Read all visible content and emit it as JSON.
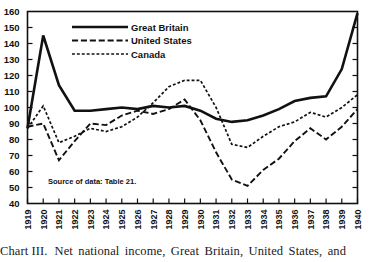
{
  "caption": {
    "number": "Chart III.",
    "text": "Net national income, Great Britain, United States, and"
  },
  "annotation": {
    "source": "Source of data:  Table 21."
  },
  "legend": {
    "position": "top-left-inside",
    "entries": [
      {
        "label": "Great Britain",
        "style": "solid"
      },
      {
        "label": "United States",
        "style": "long-dash"
      },
      {
        "label": "Canada",
        "style": "short-dash"
      }
    ]
  },
  "chart_data": {
    "type": "line",
    "title": "",
    "subtitle": "",
    "xlabel": "",
    "ylabel": "",
    "grid": false,
    "xlim": [
      1919,
      1940
    ],
    "ylim": [
      40,
      160
    ],
    "ytick_step": 10,
    "yticks": [
      40,
      50,
      60,
      70,
      80,
      90,
      100,
      110,
      120,
      130,
      140,
      150,
      160
    ],
    "x": [
      1919,
      1920,
      1921,
      1922,
      1923,
      1924,
      1925,
      1926,
      1927,
      1928,
      1929,
      1930,
      1931,
      1932,
      1933,
      1934,
      1935,
      1936,
      1937,
      1938,
      1939,
      1940
    ],
    "xticks": [
      "1919",
      "1920",
      "1921",
      "1922",
      "1923",
      "1924",
      "1925",
      "1926",
      "1927",
      "1928",
      "1929",
      "1930",
      "1931",
      "1932",
      "1933",
      "1934",
      "1935",
      "1936",
      "1937",
      "1938",
      "1939",
      "1940"
    ],
    "series": [
      {
        "name": "Great Britain",
        "style": "solid",
        "width": 2.6,
        "values": [
          87,
          145,
          114,
          98,
          98,
          99,
          100,
          99,
          101,
          100,
          101,
          98,
          93,
          91,
          92,
          95,
          99,
          104,
          106,
          107,
          124,
          159
        ]
      },
      {
        "name": "United States",
        "style": "long-dash",
        "width": 1.9,
        "values": [
          88,
          90,
          67,
          79,
          90,
          89,
          95,
          98,
          96,
          99,
          105,
          92,
          72,
          55,
          51,
          61,
          68,
          79,
          87,
          80,
          88,
          99
        ]
      },
      {
        "name": "Canada",
        "style": "short-dash",
        "width": 1.7,
        "values": [
          87,
          101,
          78,
          82,
          87,
          85,
          88,
          94,
          103,
          113,
          117,
          117,
          100,
          77,
          75,
          82,
          88,
          91,
          97,
          94,
          100,
          108
        ]
      }
    ]
  }
}
